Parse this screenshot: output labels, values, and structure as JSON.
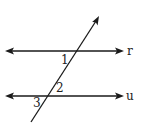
{
  "diagram": {
    "type": "parallel-lines-transversal",
    "lines": [
      {
        "name": "r",
        "label": "r",
        "y": 51,
        "x1": 6,
        "x2": 123
      },
      {
        "name": "u",
        "label": "u",
        "y": 96,
        "x1": 6,
        "x2": 123
      }
    ],
    "transversal": {
      "x1": 31,
      "y1": 122,
      "x2": 99,
      "y2": 16,
      "arrow_end": "top"
    },
    "angles": [
      {
        "label": "1",
        "x": 61,
        "y": 64
      },
      {
        "label": "2",
        "x": 56,
        "y": 92
      },
      {
        "label": "3",
        "x": 33,
        "y": 107
      }
    ],
    "colors": {
      "stroke": "#1a1a1a",
      "text": "#222222",
      "background": "#ffffff"
    }
  }
}
